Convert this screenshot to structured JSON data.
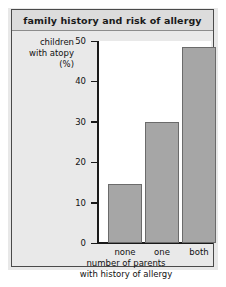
{
  "figure": {
    "title": "family history and risk of allergy"
  },
  "chart_data": {
    "type": "bar",
    "title": "family history and risk of allergy",
    "categories": [
      "none",
      "one",
      "both"
    ],
    "values": [
      14.5,
      30,
      48.5
    ],
    "xlabel": "number of parents with history of allergy",
    "xlabel_line1": "number of parents",
    "xlabel_line2": "with history of allergy",
    "ylabel": "children with atopy (%)",
    "ylabel_line1": "children",
    "ylabel_line2": "with atopy",
    "ylabel_line3": "(%)",
    "ylim": [
      0,
      50
    ],
    "yticks": [
      0,
      10,
      20,
      30,
      40,
      50
    ],
    "ytick_labels": [
      "0",
      "10",
      "20",
      "30",
      "40",
      "50"
    ],
    "grid": false,
    "legend": "none",
    "bar_color": "#a6a6a6",
    "bar_edge_color": "#6b6b6b",
    "plot_background": "#ffffff",
    "figure_background": "#e9e9e9"
  }
}
